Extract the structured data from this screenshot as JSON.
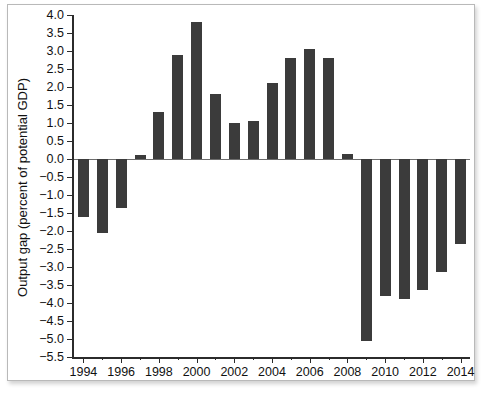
{
  "chart_data": {
    "type": "bar",
    "title": "",
    "xlabel": "",
    "ylabel": "Output gap (percent of potential GDP)",
    "categories": [
      1994,
      1995,
      1996,
      1997,
      1998,
      1999,
      2000,
      2001,
      2002,
      2003,
      2004,
      2005,
      2006,
      2007,
      2008,
      2009,
      2010,
      2011,
      2012,
      2013,
      2014
    ],
    "values": [
      -1.6,
      -2.05,
      -1.35,
      0.1,
      1.3,
      2.9,
      3.8,
      1.8,
      1.0,
      1.05,
      2.1,
      2.8,
      3.05,
      2.8,
      0.15,
      -5.05,
      -3.8,
      -3.9,
      -3.65,
      -3.15,
      -2.35
    ],
    "ylim": [
      -5.5,
      4.0
    ],
    "xlim": [
      1993.5,
      2014.5
    ],
    "yticks": [
      4.0,
      3.5,
      3.0,
      2.5,
      2.0,
      1.5,
      1.0,
      0.5,
      0.0,
      -0.5,
      -1.0,
      -1.5,
      -2.0,
      -2.5,
      -3.0,
      -3.5,
      -4.0,
      -4.5,
      -5.0,
      -5.5
    ],
    "ytick_labels": [
      "4.0",
      "3.5",
      "3.0",
      "2.5",
      "2.0",
      "1.5",
      "1.0",
      "0.5",
      "0.0",
      "−0.5",
      "−1.0",
      "−1.5",
      "−2.0",
      "−2.5",
      "−3.0",
      "−3.5",
      "−4.0",
      "−4.5",
      "−5.0",
      "−5.5"
    ],
    "xticks": [
      1994,
      1996,
      1998,
      2000,
      2002,
      2004,
      2006,
      2008,
      2010,
      2012,
      2014
    ],
    "xtick_labels": [
      "1994",
      "1996",
      "1998",
      "2000",
      "2002",
      "2004",
      "2006",
      "2008",
      "2010",
      "2012",
      "2014"
    ],
    "grid": false,
    "legend": null,
    "bar_color": "#3b3b3b",
    "axis_color": "#2b2b2b",
    "background": "#ffffff"
  },
  "figure": {
    "border_color": "#b9b9b9"
  }
}
